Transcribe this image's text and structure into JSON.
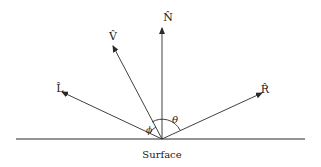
{
  "diagram": {
    "surface_label": "Surface",
    "vectors": [
      {
        "id": "N",
        "label": "N̂"
      },
      {
        "id": "V",
        "label": "V̂"
      },
      {
        "id": "L",
        "label": "L̂"
      },
      {
        "id": "R",
        "label": "R̂"
      }
    ],
    "angles": [
      {
        "id": "theta",
        "label": "θ"
      },
      {
        "id": "phi",
        "label": "ϕ"
      }
    ]
  }
}
